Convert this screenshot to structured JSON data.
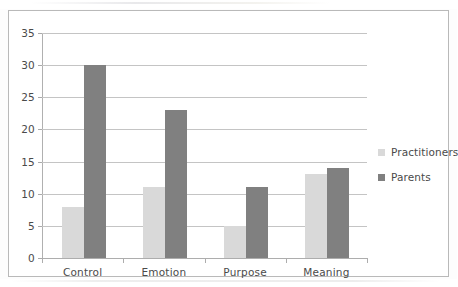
{
  "chart_data": {
    "type": "bar",
    "title": "",
    "subtitle": "",
    "xlabel": "",
    "ylabel": "",
    "categories": [
      "Control",
      "Emotion",
      "Purpose",
      "Meaning"
    ],
    "series": [
      {
        "name": "Practitioners",
        "values": [
          8,
          11,
          5,
          13
        ],
        "color": "#d9d9d9"
      },
      {
        "name": "Parents",
        "values": [
          30,
          23,
          11,
          14
        ],
        "color": "#808080"
      }
    ],
    "ylim": [
      0,
      35
    ],
    "ytick_labels": [
      "0",
      "5",
      "10",
      "15",
      "20",
      "25",
      "30",
      "35"
    ],
    "ytick_values": [
      0,
      5,
      10,
      15,
      20,
      25,
      30,
      35
    ],
    "grid": true,
    "grid_axis": "y",
    "legend_position": "right",
    "annotations": []
  },
  "style": {
    "grid_color": "#c4c4c4",
    "axis_color": "#adadad",
    "text_color": "#4a4a4a",
    "frame_color": "#b9b9b9",
    "background": "#ffffff"
  }
}
